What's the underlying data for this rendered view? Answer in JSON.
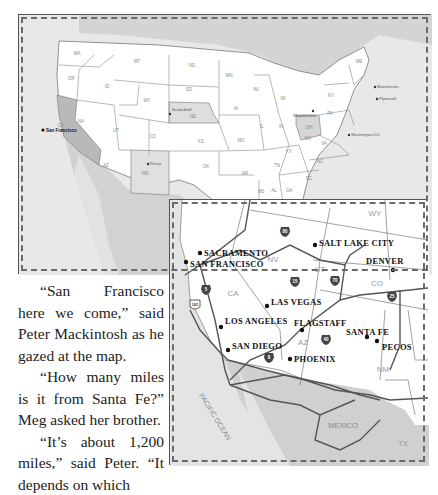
{
  "us_map": {
    "states": [
      "WA",
      "OR",
      "CA",
      "ID",
      "NV",
      "MT",
      "WY",
      "UT",
      "AZ",
      "CO",
      "NM",
      "ND",
      "SD",
      "NE",
      "KS",
      "OK",
      "TX",
      "MN",
      "IA",
      "MO",
      "AR",
      "WI",
      "IL",
      "MI",
      "IN",
      "OH",
      "KY",
      "TN",
      "MS",
      "AL",
      "GA",
      "SC",
      "NC",
      "VA",
      "WV",
      "PA",
      "NY",
      "ME",
      "VT",
      "NH",
      "MA"
    ],
    "highlighted_states": [
      "CA",
      "NE",
      "NM",
      "OH"
    ],
    "cities": [
      {
        "name": "San Francisco",
        "bold": true
      },
      {
        "name": "Scottsbluff"
      },
      {
        "name": "Pecos"
      },
      {
        "name": "Wapakoneta"
      },
      {
        "name": "Washington DC"
      },
      {
        "name": "Manchester"
      },
      {
        "name": "Plymouth"
      }
    ]
  },
  "inset_map": {
    "cities": [
      "Sacramento",
      "San Francisco",
      "Salt Lake City",
      "Denver",
      "Las Vegas",
      "Los Angeles",
      "Flagstaff",
      "Santa Fe",
      "Pecos",
      "San Diego",
      "Phoenix"
    ],
    "states": [
      "WY",
      "NV",
      "UT",
      "CO",
      "CA",
      "AZ",
      "NM",
      "TX"
    ],
    "regions": [
      "Pacific Ocean",
      "Mexico"
    ],
    "highways": [
      {
        "type": "interstate",
        "number": "80"
      },
      {
        "type": "interstate",
        "number": "15"
      },
      {
        "type": "interstate",
        "number": "70"
      },
      {
        "type": "interstate",
        "number": "25"
      },
      {
        "type": "interstate",
        "number": "5"
      },
      {
        "type": "interstate",
        "number": "40"
      },
      {
        "type": "interstate",
        "number": "8"
      },
      {
        "type": "us",
        "number": "101"
      }
    ]
  },
  "story": {
    "paragraphs": [
      "“San Francisco here we come,” said Peter Mackintosh as he gazed at the map.",
      "“How many miles is it from Santa Fe?” Meg asked her brother.",
      "“It’s about 1,200 miles,” said Peter. “It depends on which"
    ]
  },
  "colors": {
    "land": "#ffffff",
    "water": "#e6e6e6",
    "highlight_state": "#bdbdbd",
    "mexico": "#d0d0d0",
    "road": "#555555",
    "label": "#8a8a8a",
    "city": "#111111"
  }
}
